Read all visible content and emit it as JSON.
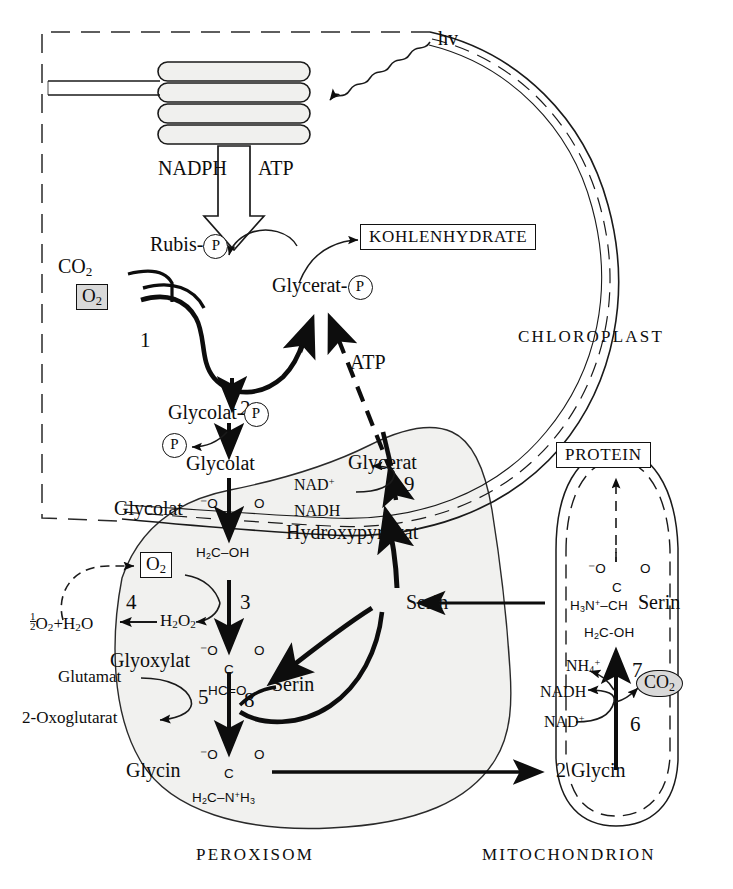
{
  "compartments": {
    "chloroplast": "CHLOROPLAST",
    "peroxisome": "PEROXISOM",
    "mitochondrion": "MITOCHONDRION"
  },
  "boxed_products": {
    "carbohydrate": "KOHLENHYDRATE",
    "protein": "PROTEIN"
  },
  "light": {
    "label": "hv"
  },
  "thylakoid_output": {
    "nadph": "NADPH",
    "atp": "ATP"
  },
  "chloroplast_metabolites": {
    "co2": "CO2",
    "o2_boxed": "O2",
    "rubisp_name": "Rubis-",
    "rubisp_group": "P",
    "gly_p_name": "Glycerat-",
    "gly_p_group": "P",
    "glycolat_p_name": "Glycolat-",
    "glycolat_p_group": "P",
    "phosphate_released": "P",
    "glycolat": "Glycolat",
    "atp_transport": "ATP"
  },
  "peroxisome_metabolites": {
    "glycolat": "Glycolat",
    "glycolat_struct_top": "⁻O",
    "glycolat_struct_o": "O",
    "glycolat_struct_c": "C",
    "glycolat_struct_bottom": "H2C–OH",
    "o2_boxed": "O2",
    "h2o2": "H2O2",
    "water_products": "O2+H2O",
    "water_half": "1/2",
    "glyoxylat": "Glyoxylat",
    "glyoxylat_struct_top": "⁻O",
    "glyoxylat_struct_o": "O",
    "glyoxylat_struct_c": "C",
    "glyoxylat_struct_bottom": "HC=O",
    "glutamat": "Glutamat",
    "oxoglutarat": "2-Oxoglutarat",
    "serin_in": "Serin",
    "serin_hub": "Serin",
    "glycin": "Glycin",
    "glycin_struct_top": "⁻O",
    "glycin_struct_o": "O",
    "glycin_struct_c": "C",
    "glycin_struct_bottom": "H2C–N+H3",
    "glycerat": "Glycerat",
    "hydroxypyruvat": "Hydroxypyruvat",
    "nad_plus": "NAD+",
    "nadh": "NADH"
  },
  "mitochondrion_metabolites": {
    "serin": "Serin",
    "serin_struct_top": "⁻O",
    "serin_struct_o": "O",
    "serin_struct_c": "C",
    "serin_struct_mid": "H3N+–CH",
    "serin_struct_bottom": "H2C-OH",
    "nh4": "NH4+",
    "nadh": "NADH",
    "nad_plus": "NAD+",
    "co2": "CO2",
    "glycin": "2 Glycin"
  },
  "enzyme_steps": [
    {
      "id": "1",
      "label": "1",
      "reaction": "RubisCO oxygenase"
    },
    {
      "id": "2",
      "label": "2",
      "reaction": "Phosphoglycolate phosphatase"
    },
    {
      "id": "3",
      "label": "3",
      "reaction": "Glycolate oxidase"
    },
    {
      "id": "4",
      "label": "4",
      "reaction": "Catalase"
    },
    {
      "id": "5",
      "label": "5",
      "reaction": "Glutamate:glyoxylate aminotransferase"
    },
    {
      "id": "6",
      "label": "6",
      "reaction": "Glycine decarboxylase"
    },
    {
      "id": "7",
      "label": "7",
      "reaction": "Serine hydroxymethyltransferase"
    },
    {
      "id": "8",
      "label": "8",
      "reaction": "Serine:glyoxylate aminotransferase"
    },
    {
      "id": "9",
      "label": "9",
      "reaction": "Hydroxypyruvate reductase"
    }
  ],
  "colors": {
    "ink": "#0d0d0d",
    "gray_fill": "#d9d9d9",
    "organelle_fill": "#f1f1ef",
    "white": "#ffffff"
  }
}
